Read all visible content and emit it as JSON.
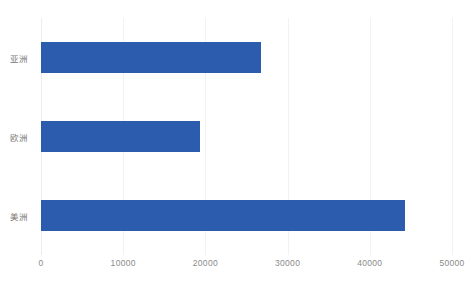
{
  "chart_data": {
    "type": "bar",
    "orientation": "horizontal",
    "title": "",
    "subtitle": "",
    "xlabel": "",
    "ylabel": "",
    "categories": [
      "亚洲",
      "欧洲",
      "美洲"
    ],
    "values": [
      26800,
      19300,
      44300
    ],
    "series": [
      {
        "name": "",
        "values": [
          26800,
          19300,
          44300
        ],
        "color": "#2b5cae"
      }
    ],
    "xlim": [
      0,
      50000
    ],
    "xticks": [
      0,
      10000,
      20000,
      30000,
      40000,
      50000
    ],
    "xtick_labels": [
      "0",
      "10000",
      "20000",
      "30000",
      "40000",
      "50000"
    ],
    "ytick_labels": [
      "亚洲",
      "欧洲",
      "美洲"
    ],
    "grid": "vertical",
    "gridline_color": "#f2f2f2",
    "legend": null,
    "legend_position": "none",
    "annotations": [],
    "data_labels": false,
    "background_color": "#ffffff",
    "bar_color": "#2b5cae",
    "tick_label_color": "#8a8a8a",
    "category_label_color": "#7a7a7a"
  }
}
